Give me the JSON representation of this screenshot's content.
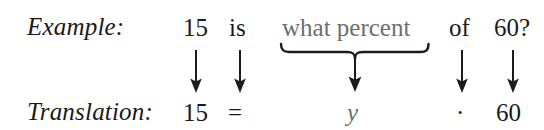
{
  "figure": {
    "type": "percent-problem-translation-diagram",
    "background_color": "#ffffff",
    "text_color": "#1a1a1a",
    "highlight_color": "#6e6e6e"
  },
  "rows": {
    "example": {
      "label": "Example:",
      "terms": {
        "number": "15",
        "verb": "is",
        "unknown_phrase": "what percent",
        "preposition": "of",
        "base": "60?"
      }
    },
    "translation": {
      "label": "Translation:",
      "terms": {
        "number": "15",
        "equals": "=",
        "variable": "y",
        "times": "·",
        "base": "60"
      }
    }
  },
  "connectors": {
    "arrow_number": "down-arrow",
    "arrow_verb": "down-arrow",
    "brace_unknown": "underbrace-with-down-arrow",
    "arrow_preposition": "down-arrow",
    "arrow_base": "down-arrow"
  }
}
